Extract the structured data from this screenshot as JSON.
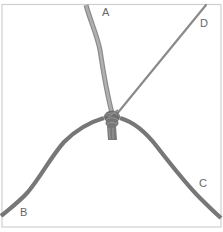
{
  "diagram": {
    "type": "knot-illustration",
    "cords": [
      {
        "id": "A",
        "label": "A",
        "from": "top",
        "color": "#9a9a9a"
      },
      {
        "id": "B",
        "label": "B",
        "from": "bottom-left",
        "color": "#7a7a7a"
      },
      {
        "id": "C",
        "label": "C",
        "from": "bottom-right",
        "color": "#7a7a7a"
      },
      {
        "id": "D",
        "label": "D",
        "from": "top-right",
        "color": "#8a8a8a"
      }
    ],
    "knot": {
      "x": 113,
      "y": 118,
      "color": "#6a6a6a"
    },
    "frame_color": "#d0d0d0"
  }
}
